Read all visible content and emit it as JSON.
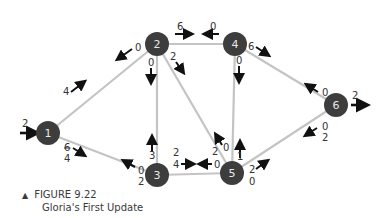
{
  "figure": {
    "number_label": "FIGURE 9.22",
    "title": "Gloria's First Update",
    "marker": "▲"
  },
  "colors": {
    "node_fill": "#3d3d3d",
    "edge": "#c4c4c4",
    "arrow": "#111111",
    "text": "#333333"
  },
  "nodes": [
    {
      "id": "1",
      "label": "1"
    },
    {
      "id": "2",
      "label": "2"
    },
    {
      "id": "3",
      "label": "3"
    },
    {
      "id": "4",
      "label": "4"
    },
    {
      "id": "5",
      "label": "5"
    },
    {
      "id": "6",
      "label": "6"
    }
  ],
  "edges": [
    {
      "from": "1",
      "to": "2"
    },
    {
      "from": "1",
      "to": "3"
    },
    {
      "from": "2",
      "to": "4"
    },
    {
      "from": "2",
      "to": "3"
    },
    {
      "from": "2",
      "to": "5"
    },
    {
      "from": "3",
      "to": "5"
    },
    {
      "from": "4",
      "to": "5"
    },
    {
      "from": "4",
      "to": "6"
    },
    {
      "from": "5",
      "to": "6"
    }
  ],
  "flows": {
    "source_in": "2",
    "sink_out": "2",
    "e12_forward": "4",
    "e12_back": "0",
    "e13_forward_old": "6",
    "e13_forward_new": "4",
    "e13_back_old": "0",
    "e13_back_new": "2",
    "e24_forward": "6",
    "e24_back": "0",
    "e23_down": "0",
    "e23_up": "3",
    "e25_down": "2",
    "e25_up_old": "2",
    "e25_up_new": "0",
    "e35_forward_old": "4",
    "e35_forward_new": "2",
    "e35_back_old": "0",
    "e35_back_new": "2",
    "e45_down": "0",
    "e45_up": "1",
    "e46_forward": "6",
    "e46_back": "0",
    "e56_forward_old": "2",
    "e56_forward_new": "0",
    "e56_back_old": "0",
    "e56_back_new": "2"
  }
}
